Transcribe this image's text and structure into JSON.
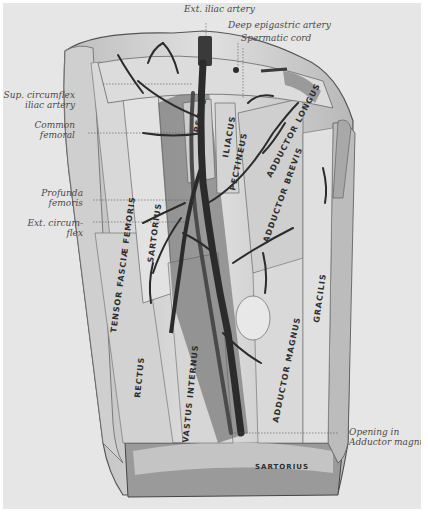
{
  "figure": {
    "background_color": "#e6e6e6",
    "border_color": "#ffffff",
    "vessel_color": "#2b2b2b",
    "muscle_color": "#d4d4d4"
  },
  "callouts": {
    "ext_iliac": "Ext. iliac artery",
    "deep_epigastric": "Deep epigastric artery",
    "spermatic_cord": "Spermatic cord",
    "sup_circumflex_1": "Sup. circumflex",
    "sup_circumflex_2": "iliac artery",
    "common_femoral_1": "Common",
    "common_femoral_2": "femoral",
    "profunda_1": "Profunda",
    "profunda_2": "femoris",
    "ext_circumflex_1": "Ext. circum-",
    "ext_circumflex_2": "flex",
    "opening_1": "Opening in",
    "opening_2": "Adductor magnus"
  },
  "muscle_labels": {
    "tensor": "TENSOR FASCIÆ FEMORIS",
    "sartorius_upper": "SARTORIUS",
    "psoas": "PSOAS",
    "iliacus": "ILIACUS",
    "pectineus": "PECTINEUS",
    "adductor_longus": "ADDUCTOR LONGUS",
    "adductor_brevis": "ADDUCTOR BREVIS",
    "gracilis": "GRACILIS",
    "rectus": "RECTUS",
    "vastus_internus": "VASTUS INTERNUS",
    "adductor_magnus": "ADDUCTOR MAGNUS",
    "sartorius_lower": "SARTORIUS"
  }
}
